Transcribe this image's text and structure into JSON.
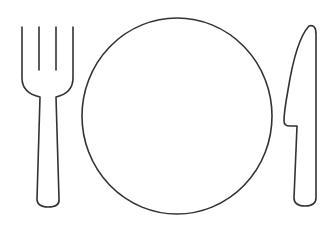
{
  "scene": {
    "title": "Place setting icon",
    "background": "#ffffff",
    "stroke_color": "#333333",
    "items": [
      {
        "name": "fork",
        "icon": "fork-icon"
      },
      {
        "name": "plate",
        "icon": "plate-icon"
      },
      {
        "name": "knife",
        "icon": "knife-icon"
      }
    ]
  }
}
